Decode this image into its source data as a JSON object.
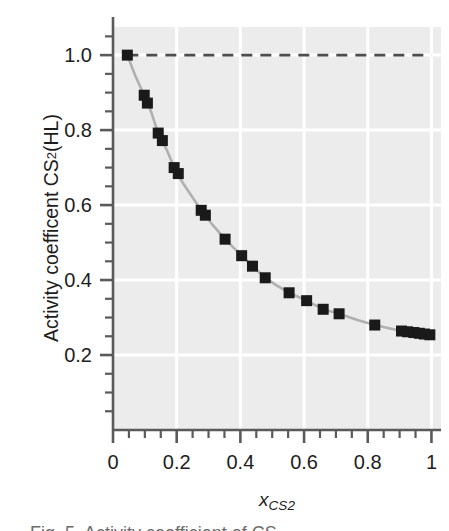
{
  "figure": {
    "background_color": "#ffffff",
    "plot_background_color": "#ececec",
    "gridline_color": "#ffffff",
    "axis_color": "#5a5a5a",
    "marker_color": "#1a1a1a",
    "line_color": "#b0b0b0",
    "refline_color": "#4d4d4d"
  },
  "axis": {
    "y_title_main": "Activity coefficent CS",
    "y_title_sub": "2",
    "y_title_tail": " (HL)",
    "x_title_symbol": "x",
    "x_title_sub_main": "CS",
    "x_title_sub_digit": "2",
    "y_ticks": [
      "0.2",
      "0.4",
      "0.6",
      "0.8",
      "1.0"
    ],
    "x_ticks": [
      "0",
      "0.2",
      "0.4",
      "0.6",
      "0.8",
      "1"
    ]
  },
  "caption": {
    "sliver_text": "Fig. 5. Activity coefficient of CS"
  },
  "chart_data": {
    "type": "scatter",
    "title": "",
    "subtitle": "",
    "xlabel": "x_CS2",
    "ylabel": "Activity coefficent CS2 (HL)",
    "xlim": [
      0,
      1.03
    ],
    "ylim": [
      0,
      1.075
    ],
    "grid": true,
    "gridlines_x": [
      0.2,
      0.4,
      0.6,
      0.8,
      1.0
    ],
    "gridlines_y": [
      0.2,
      0.4,
      0.6,
      0.8,
      1.0
    ],
    "x_major_ticks": [
      0,
      0.2,
      0.4,
      0.6,
      0.8,
      1.0
    ],
    "x_minor_ticks": [
      0.05,
      0.1,
      0.15,
      0.25,
      0.3,
      0.35,
      0.45,
      0.5,
      0.55,
      0.65,
      0.7,
      0.75,
      0.85,
      0.9,
      0.95
    ],
    "y_major_ticks": [
      0.2,
      0.4,
      0.6,
      0.8,
      1.0
    ],
    "y_minor_ticks": [
      0.05,
      0.1,
      0.15,
      0.25,
      0.3,
      0.35,
      0.45,
      0.5,
      0.55,
      0.65,
      0.7,
      0.75,
      0.85,
      0.9,
      0.95,
      1.05
    ],
    "legend": [],
    "legend_position": "none",
    "annotations": [
      {
        "type": "reference_line",
        "orientation": "horizontal",
        "y": 1.0,
        "style": "dashed",
        "x_start": 0.045,
        "x_end": 1.0
      }
    ],
    "series": [
      {
        "name": "Activity coefficient CS2 (HL)",
        "marker": "square",
        "marker_size": 11,
        "connected": true,
        "line_style": "solid",
        "points": [
          [
            0.045,
            1.0
          ],
          [
            0.098,
            0.893
          ],
          [
            0.108,
            0.872
          ],
          [
            0.142,
            0.792
          ],
          [
            0.155,
            0.772
          ],
          [
            0.192,
            0.7
          ],
          [
            0.205,
            0.684
          ],
          [
            0.277,
            0.586
          ],
          [
            0.29,
            0.573
          ],
          [
            0.352,
            0.509
          ],
          [
            0.404,
            0.465
          ],
          [
            0.438,
            0.437
          ],
          [
            0.478,
            0.406
          ],
          [
            0.553,
            0.366
          ],
          [
            0.608,
            0.345
          ],
          [
            0.66,
            0.322
          ],
          [
            0.71,
            0.31
          ],
          [
            0.822,
            0.28
          ],
          [
            0.906,
            0.264
          ],
          [
            0.925,
            0.262
          ],
          [
            0.945,
            0.26
          ],
          [
            0.962,
            0.258
          ],
          [
            0.978,
            0.256
          ],
          [
            0.995,
            0.254
          ]
        ],
        "curve": [
          [
            0.045,
            1.0
          ],
          [
            0.07,
            0.945
          ],
          [
            0.098,
            0.893
          ],
          [
            0.12,
            0.848
          ],
          [
            0.142,
            0.792
          ],
          [
            0.17,
            0.745
          ],
          [
            0.192,
            0.7
          ],
          [
            0.22,
            0.658
          ],
          [
            0.25,
            0.62
          ],
          [
            0.277,
            0.586
          ],
          [
            0.31,
            0.55
          ],
          [
            0.352,
            0.509
          ],
          [
            0.38,
            0.485
          ],
          [
            0.404,
            0.465
          ],
          [
            0.438,
            0.437
          ],
          [
            0.478,
            0.406
          ],
          [
            0.515,
            0.385
          ],
          [
            0.553,
            0.366
          ],
          [
            0.608,
            0.345
          ],
          [
            0.66,
            0.322
          ],
          [
            0.71,
            0.31
          ],
          [
            0.77,
            0.293
          ],
          [
            0.822,
            0.28
          ],
          [
            0.87,
            0.271
          ],
          [
            0.906,
            0.264
          ],
          [
            0.95,
            0.259
          ],
          [
            0.995,
            0.254
          ]
        ]
      }
    ]
  }
}
